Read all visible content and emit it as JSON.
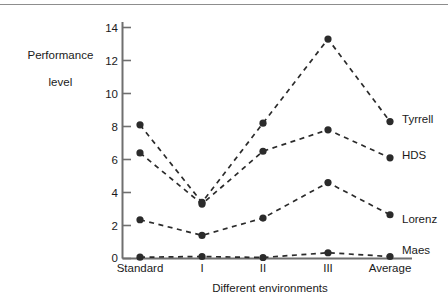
{
  "chart_data": {
    "type": "line",
    "title": "",
    "xlabel": "Different environments",
    "ylabel": "Performance level",
    "categories": [
      "Standard",
      "I",
      "II",
      "III",
      "Average"
    ],
    "yticks": [
      0,
      2,
      4,
      6,
      8,
      10,
      12,
      14
    ],
    "ylim": [
      0,
      15
    ],
    "grid": false,
    "legend_position": "right-inline-end-of-line",
    "marker": "filled-circle",
    "line_style": "dashed",
    "series": [
      {
        "name": "Tyrrell",
        "values": [
          8.1,
          3.4,
          8.2,
          13.3,
          8.3
        ]
      },
      {
        "name": "HDS",
        "values": [
          6.4,
          3.3,
          6.5,
          7.8,
          6.1
        ]
      },
      {
        "name": "Lorenz",
        "values": [
          2.35,
          1.4,
          2.45,
          4.6,
          2.65
        ]
      },
      {
        "name": "Maes",
        "values": [
          0.08,
          0.12,
          0.06,
          0.35,
          0.12
        ]
      }
    ]
  },
  "axes": {
    "y_title_line1": "Performance",
    "y_title_line2": "level",
    "x_title": "Different environments",
    "y_tick_labels": [
      "14",
      "12",
      "10",
      "8",
      "6",
      "4",
      "2",
      "0"
    ],
    "x_tick_labels": [
      "Standard",
      "I",
      "II",
      "III",
      "Average"
    ]
  },
  "series_labels": [
    "Tyrrell",
    "HDS",
    "Lorenz",
    "Maes"
  ],
  "colors": {
    "ink": "#1a1a1a",
    "axis": "#6f6f6f",
    "line": "#2b2b2b",
    "background": "#ffffff"
  }
}
